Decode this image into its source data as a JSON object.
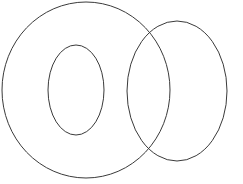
{
  "figure": {
    "kind": "venn-diagram",
    "canvas": {
      "width": 243,
      "height": 184,
      "background_color": "#ffffff"
    }
  },
  "chart_data": {
    "type": "diagram",
    "title": "",
    "subtitle": "",
    "xlabel": "",
    "ylabel": "",
    "grid": false,
    "legend": false,
    "background_color": "#ffffff",
    "shapes": [
      {
        "name": "large-left-circle",
        "shape": "ellipse",
        "cx": 86,
        "cy": 90,
        "rx": 84,
        "ry": 88,
        "stroke_color": "#3a3a3a",
        "stroke_width": 1,
        "fill": "none",
        "label": ""
      },
      {
        "name": "right-circle",
        "shape": "ellipse",
        "cx": 177,
        "cy": 91,
        "rx": 50,
        "ry": 70,
        "stroke_color": "#3a3a3a",
        "stroke_width": 1,
        "fill": "none",
        "label": ""
      },
      {
        "name": "small-inner-circle",
        "shape": "ellipse",
        "cx": 76,
        "cy": 90,
        "rx": 28,
        "ry": 45,
        "stroke_color": "#3a3a3a",
        "stroke_width": 1,
        "fill": "none",
        "label": ""
      }
    ],
    "annotations": []
  }
}
